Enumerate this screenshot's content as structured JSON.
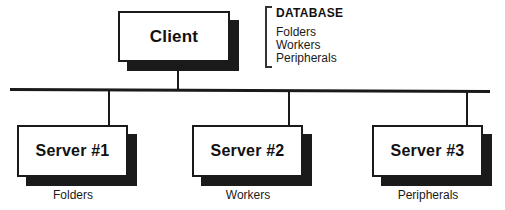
{
  "diagram": {
    "client": {
      "label": "Client"
    },
    "legend": {
      "title": "DATABASE",
      "items": [
        {
          "label": "Folders"
        },
        {
          "label": "Workers"
        },
        {
          "label": "Peripherals"
        }
      ]
    },
    "servers": [
      {
        "label": "Server #1",
        "caption": "Folders"
      },
      {
        "label": "Server #2",
        "caption": "Workers"
      },
      {
        "label": "Server #3",
        "caption": "Peripherals"
      }
    ],
    "colors": {
      "line": "#1a1a1a",
      "panel": "#ffffff",
      "shadow": "#1a1a1a",
      "text": "#111111",
      "background": "#ffffff"
    }
  }
}
